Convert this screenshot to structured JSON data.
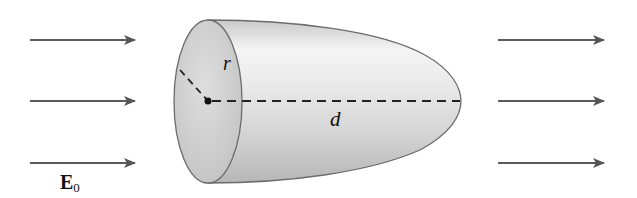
{
  "diagram": {
    "labels": {
      "radius": "r",
      "length": "d",
      "field_symbol": "E",
      "field_subscript": "0"
    },
    "field_arrows": {
      "left": [
        {
          "y": 40
        },
        {
          "y": 101
        },
        {
          "y": 163
        }
      ],
      "right": [
        {
          "y": 40
        },
        {
          "y": 101
        },
        {
          "y": 163
        }
      ],
      "direction": "right"
    },
    "colors": {
      "arrow": "#555555",
      "outline": "#6b6b6b",
      "body_light": "#f2f2f2",
      "body_dark": "#b8b8b8",
      "face": "#cfcfcf",
      "dashed": "#222222"
    }
  }
}
